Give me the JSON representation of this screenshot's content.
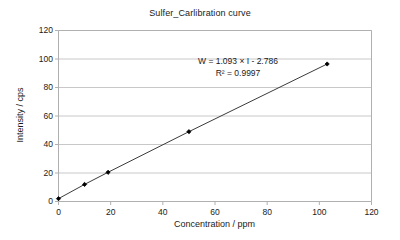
{
  "chart_data": {
    "type": "scatter",
    "title": "Sulfer_Carlibration curve",
    "xlabel": "Concentration / ppm",
    "ylabel": "Intensity / cps",
    "xlim": [
      0,
      120
    ],
    "ylim": [
      0,
      120
    ],
    "xticks": [
      0,
      20,
      40,
      60,
      80,
      100,
      120
    ],
    "yticks": [
      0,
      20,
      40,
      60,
      80,
      100,
      120
    ],
    "xtick_labels": [
      "0",
      "20",
      "40",
      "60",
      "80",
      "100",
      "120"
    ],
    "ytick_labels": [
      "0",
      "20",
      "40",
      "60",
      "80",
      "100",
      "120"
    ],
    "grid": "horizontal",
    "legend": "none",
    "series": [
      {
        "name": "Sulfur calibration",
        "marker": "filled-diamond",
        "marker_color": "#000000",
        "line_color": "#3b3b3b",
        "x": [
          0,
          10,
          19,
          50,
          103
        ],
        "y": [
          2,
          12,
          20.5,
          49,
          96.5
        ],
        "points": [
          {
            "x": 0,
            "y": 2
          },
          {
            "x": 10,
            "y": 12
          },
          {
            "x": 19,
            "y": 20.5
          },
          {
            "x": 50,
            "y": 49
          },
          {
            "x": 103,
            "y": 96.5
          }
        ]
      }
    ],
    "trendline": {
      "type": "linear",
      "slope": 1.093,
      "intercept": -2.786,
      "r_squared": 0.9997,
      "equation_text": "W = 1.093 × I - 2.786",
      "r2_text": "R² = 0.9997"
    },
    "annotations": [
      {
        "text": "W = 1.093 × I - 2.786"
      },
      {
        "text": "R² = 0.9997"
      }
    ],
    "colors": {
      "plot_border": "#b0b0b0",
      "gridline": "#c8c8c8",
      "axis_text": "#1a1a1a",
      "series_line": "#3b3b3b",
      "background": "#ffffff"
    }
  }
}
